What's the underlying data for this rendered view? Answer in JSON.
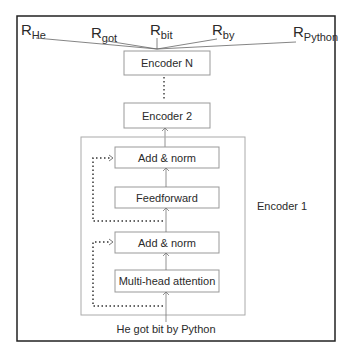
{
  "outputs": [
    {
      "main": "R",
      "sub": "He"
    },
    {
      "main": "R",
      "sub": "got"
    },
    {
      "main": "R",
      "sub": "bit"
    },
    {
      "main": "R",
      "sub": "by"
    },
    {
      "main": "R",
      "sub": "Python"
    }
  ],
  "encoders": {
    "top": "Encoder N",
    "second": "Encoder 2",
    "first_label": "Encoder 1"
  },
  "layers": {
    "add_norm_top": "Add & norm",
    "feedforward": "Feedforward",
    "add_norm_bottom": "Add & norm",
    "attention": "Multi-head attention"
  },
  "input_sentence": "He got bit by Python"
}
